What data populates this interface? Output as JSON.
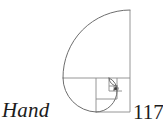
{
  "page": {
    "background_color": "#ffffff",
    "width": 163,
    "height": 137
  },
  "caption": {
    "word": "Hand",
    "style": "italic-serif",
    "color": "#1c1c1c"
  },
  "folio": {
    "page_number": "117",
    "clipped_at_right_edge": true,
    "color": "#1c1c1c"
  },
  "figure": {
    "name": "golden-ratio-fibonacci-spiral",
    "stroke_color": "#6e6e6e",
    "square_stroke_color": "#8a8a8a",
    "fill": "none",
    "bounds": {
      "x": 63,
      "y": 10,
      "width": 67,
      "height": 108
    },
    "squares": [
      {
        "name": "square-1",
        "x": 63,
        "y": 10,
        "size": 67
      },
      {
        "name": "square-2",
        "x": 96,
        "y": 78,
        "size": 34
      },
      {
        "name": "square-3",
        "x": 96,
        "y": 78,
        "size": 21
      },
      {
        "name": "square-4",
        "x": 109,
        "y": 78,
        "size": 13
      },
      {
        "name": "square-5",
        "x": 109,
        "y": 86,
        "size": 8
      },
      {
        "name": "square-6",
        "x": 114,
        "y": 86,
        "size": 5
      },
      {
        "name": "square-7",
        "x": 114,
        "y": 89,
        "size": 3
      },
      {
        "name": "square-8",
        "x": 116,
        "y": 89,
        "size": 2
      }
    ],
    "arcs": [
      {
        "name": "arc-1",
        "from": [
          130,
          10
        ],
        "to": [
          63,
          78
        ],
        "radius": 67
      },
      {
        "name": "arc-2",
        "from": [
          63,
          78
        ],
        "to": [
          96,
          112
        ],
        "radius": 34
      },
      {
        "name": "arc-3",
        "from": [
          96,
          112
        ],
        "to": [
          117,
          91
        ],
        "radius": 21
      },
      {
        "name": "arc-4",
        "from": [
          117,
          91
        ],
        "to": [
          109,
          78
        ],
        "radius": 13
      },
      {
        "name": "arc-5",
        "from": [
          109,
          78
        ],
        "to": [
          117,
          86
        ],
        "radius": 8
      },
      {
        "name": "arc-6",
        "from": [
          117,
          86
        ],
        "to": [
          119,
          91
        ],
        "radius": 5
      }
    ]
  }
}
